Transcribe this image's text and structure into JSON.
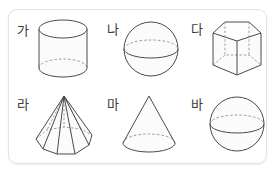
{
  "panel": {
    "background_color": "#ffffff",
    "border_color": "#e3e3e3"
  },
  "style": {
    "stroke_color": "#4a4a4a",
    "hidden_stroke_color": "#8d8d8d",
    "fill_color": "#fbfbfb",
    "label_color": "#3a3a3a"
  },
  "figures": [
    {
      "label": "가",
      "shape": "cylinder",
      "row": 0,
      "column": 0,
      "hidden_edges": "dashed-bottom-back-arc"
    },
    {
      "label": "나",
      "shape": "sphere",
      "row": 0,
      "column": 1,
      "hidden_edges": "dashed-equator-back-arc"
    },
    {
      "label": "다",
      "shape": "pentagonal-prism",
      "row": 0,
      "column": 2,
      "hidden_edges": "dashed-back-vertical-and-base-edges"
    },
    {
      "label": "라",
      "shape": "heptagonal-pyramid",
      "row": 1,
      "column": 0,
      "hidden_edges": "dashed-back-base-edges-and-lateral-edge"
    },
    {
      "label": "마",
      "shape": "cone",
      "row": 1,
      "column": 1,
      "hidden_edges": "dashed-base-back-arc"
    },
    {
      "label": "바",
      "shape": "sphere",
      "row": 1,
      "column": 2,
      "hidden_edges": "dashed-equator-back-arc"
    }
  ]
}
